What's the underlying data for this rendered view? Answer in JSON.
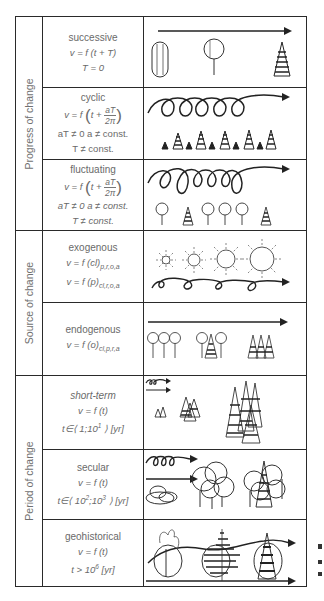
{
  "groups": [
    {
      "label": "Progress of change"
    },
    {
      "label": "Source of change"
    },
    {
      "label": "Period of change"
    }
  ],
  "rows": [
    {
      "title": "successive",
      "eq1": "v = f (t + T)",
      "eq2": "T = 0",
      "drawing": "oval-tree, round-tree, conifer with arrow"
    },
    {
      "title": "cyclic",
      "eq_prefix": "v = f",
      "eq_inner": "t +",
      "frac_num": "aT",
      "frac_den": "2π",
      "cond1": "aT ≠ 0    a ≠ const.",
      "cond2": "T ≠ const.",
      "drawing": "looping arrow over alternating small and tall conifers"
    },
    {
      "title": "fluctuating",
      "eq_prefix": "v = f",
      "eq_inner": "t +",
      "frac_num": "aT",
      "frac_den": "2π",
      "cond1": "aT ≠ 0   a ≠ const.",
      "cond2": "T ≠ const.",
      "drawing": "looping arrow over deciduous trees and conifers"
    },
    {
      "title": "exogenous",
      "eq1": "v = f (cl)",
      "eq1_sub": "p,r,o,a",
      "eq2": "v = f (p)",
      "eq2_sub": "cl,r,o,a",
      "drawing": "growing suns over looping arrow"
    },
    {
      "title": "endogenous",
      "eq1": "v = f (o)",
      "eq1_sub": "cl,p,r,a",
      "drawing": "arrow over deciduous trees changing to conifers"
    },
    {
      "title": "short-term",
      "eq1": "v = f (t)",
      "range_prefix": "t∈⟨ 1;10",
      "range_sup": "1",
      "range_suffix": " ⟩ [yr]",
      "drawing": "small arrows, conifer groups of increasing size"
    },
    {
      "title": "secular",
      "eq1": "v = f (t)",
      "range_prefix": "t∈⟨ 10",
      "range_sup": "2",
      "range_mid": ";10",
      "range_sup2": "3",
      "range_suffix": " ⟩ [yr]",
      "drawing": "looping arrow, shrubs, deciduous forest, mixed forest"
    },
    {
      "title": "geohistorical",
      "eq1": "v = f (t)",
      "range_prefix": "t > 10",
      "range_sup": "6",
      "range_suffix": " [yr]",
      "drawing": "wave arrow through circled vegetation stages, straight arrow below"
    }
  ]
}
